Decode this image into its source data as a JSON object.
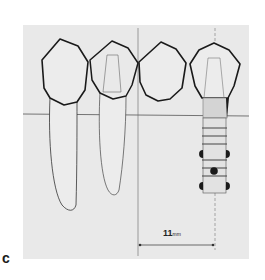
{
  "figure": {
    "panel_label": "c",
    "measurement": {
      "value": "11",
      "unit": "mm"
    },
    "colors": {
      "background": "#e9e9e9",
      "outline": "#1a1a1a",
      "implant": "#555555"
    }
  }
}
